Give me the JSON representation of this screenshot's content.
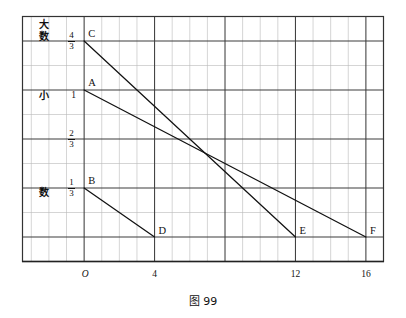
{
  "figure": {
    "caption": "图 99",
    "axis_titles": {
      "big_number": "大数",
      "big_number_char1": "大",
      "big_number_char2": "数",
      "small_number_char1": "小",
      "small_number_char2": "数"
    }
  },
  "chart_data": {
    "type": "line",
    "title": "图 99",
    "xlabel": "",
    "ylabel": "",
    "grid": true,
    "legend": "none",
    "xlim": [
      -3.5,
      17
    ],
    "ylim": [
      -0.1667,
      1.5
    ],
    "x_ticks": [
      {
        "value": 0,
        "label": "O",
        "style": "italic"
      },
      {
        "value": 4,
        "label": "4",
        "style": "normal"
      },
      {
        "value": 12,
        "label": "12",
        "style": "normal"
      },
      {
        "value": 16,
        "label": "16",
        "style": "normal"
      }
    ],
    "y_ticks": [
      {
        "value": 1.3333,
        "label": "4/3",
        "numerator": "4",
        "denominator": "3"
      },
      {
        "value": 1.0,
        "label": "1",
        "numerator": "1",
        "denominator": ""
      },
      {
        "value": 0.6667,
        "label": "2/3",
        "numerator": "2",
        "denominator": "3"
      },
      {
        "value": 0.3333,
        "label": "1/3",
        "numerator": "1",
        "denominator": "3"
      }
    ],
    "grid_minor_x_step": 1,
    "grid_minor_y_step": 0.16667,
    "grid_major_x_step": 4,
    "series": [
      {
        "name": "CE",
        "start_label": "C",
        "end_label": "E",
        "x": [
          0,
          12
        ],
        "y": [
          1.3333,
          0
        ]
      },
      {
        "name": "AF",
        "start_label": "A",
        "end_label": "F",
        "x": [
          0,
          16
        ],
        "y": [
          1.0,
          0
        ]
      },
      {
        "name": "BD",
        "start_label": "B",
        "end_label": "D",
        "x": [
          0,
          4
        ],
        "y": [
          0.3333,
          0
        ]
      }
    ],
    "point_labels": [
      {
        "id": "C",
        "x": 0,
        "y": 1.3333
      },
      {
        "id": "A",
        "x": 0,
        "y": 1.0
      },
      {
        "id": "B",
        "x": 0,
        "y": 0.3333
      },
      {
        "id": "D",
        "x": 4,
        "y": 0
      },
      {
        "id": "E",
        "x": 12,
        "y": 0
      },
      {
        "id": "F",
        "x": 16,
        "y": 0
      }
    ]
  }
}
